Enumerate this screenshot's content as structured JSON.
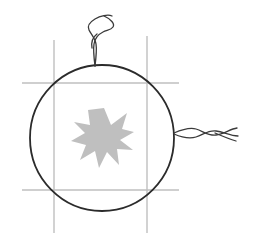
{
  "canvas": {
    "width": 256,
    "height": 233,
    "background_color": "#ffffff",
    "title": "Circle with starburst, grid lines and twisted wires"
  },
  "palette": {
    "grid_line_color": "#bfbfbf",
    "circle_stroke_color": "#2b2b2b",
    "wire_stroke_color": "#3a3a3a",
    "star_fill_color": "#bfbfbf",
    "background_color": "#ffffff"
  },
  "grid": {
    "line_color": "#bfbfbf",
    "line_width": 1.4,
    "vertical_lines": [
      {
        "name": "grid-line-vertical-left",
        "x": 54,
        "y1": 40,
        "y2": 233
      },
      {
        "name": "grid-line-vertical-right",
        "x": 147,
        "y1": 36,
        "y2": 233
      }
    ],
    "horizontal_lines": [
      {
        "name": "grid-line-horizontal-top",
        "y": 83,
        "x1": 22,
        "x2": 179
      },
      {
        "name": "grid-line-horizontal-bottom",
        "y": 190,
        "x1": 22,
        "x2": 179
      }
    ]
  },
  "circle": {
    "center_x": 102,
    "center_y": 138,
    "radius_x": 72,
    "radius_y": 73,
    "stroke_color": "#2b2b2b",
    "stroke_width": 1.8,
    "fill": "none"
  },
  "star": {
    "center_x": 104,
    "center_y": 138,
    "points": 11,
    "outer_radius": 30,
    "inner_radius": 13,
    "fill_color": "#bfbfbf",
    "rotation_deg": -8,
    "path": "M 104 108 L 111 125 L 127 113 L 122 129 L 134 132 L 120 140 L 133 150 L 117 149 L 119 165 L 107 152 L 99 168 L 95 151 L 80 160 L 86 145 L 71 141 L 85 133 L 74 122 L 90 125 L 88 110 Z"
  },
  "wires": {
    "top_wire": {
      "name": "wire-top-twisted",
      "anchor_x": 95,
      "anchor_y": 66,
      "stroke_color": "#3a3a3a",
      "stroke_width": 1.3,
      "description": "twisted thread rising from top of circle with a loop"
    },
    "right_wire": {
      "name": "wire-right-twisted",
      "anchor_x": 174,
      "anchor_y": 133,
      "stroke_color": "#3a3a3a",
      "stroke_width": 1.3,
      "description": "twisted cord extending right from circle edge"
    }
  }
}
